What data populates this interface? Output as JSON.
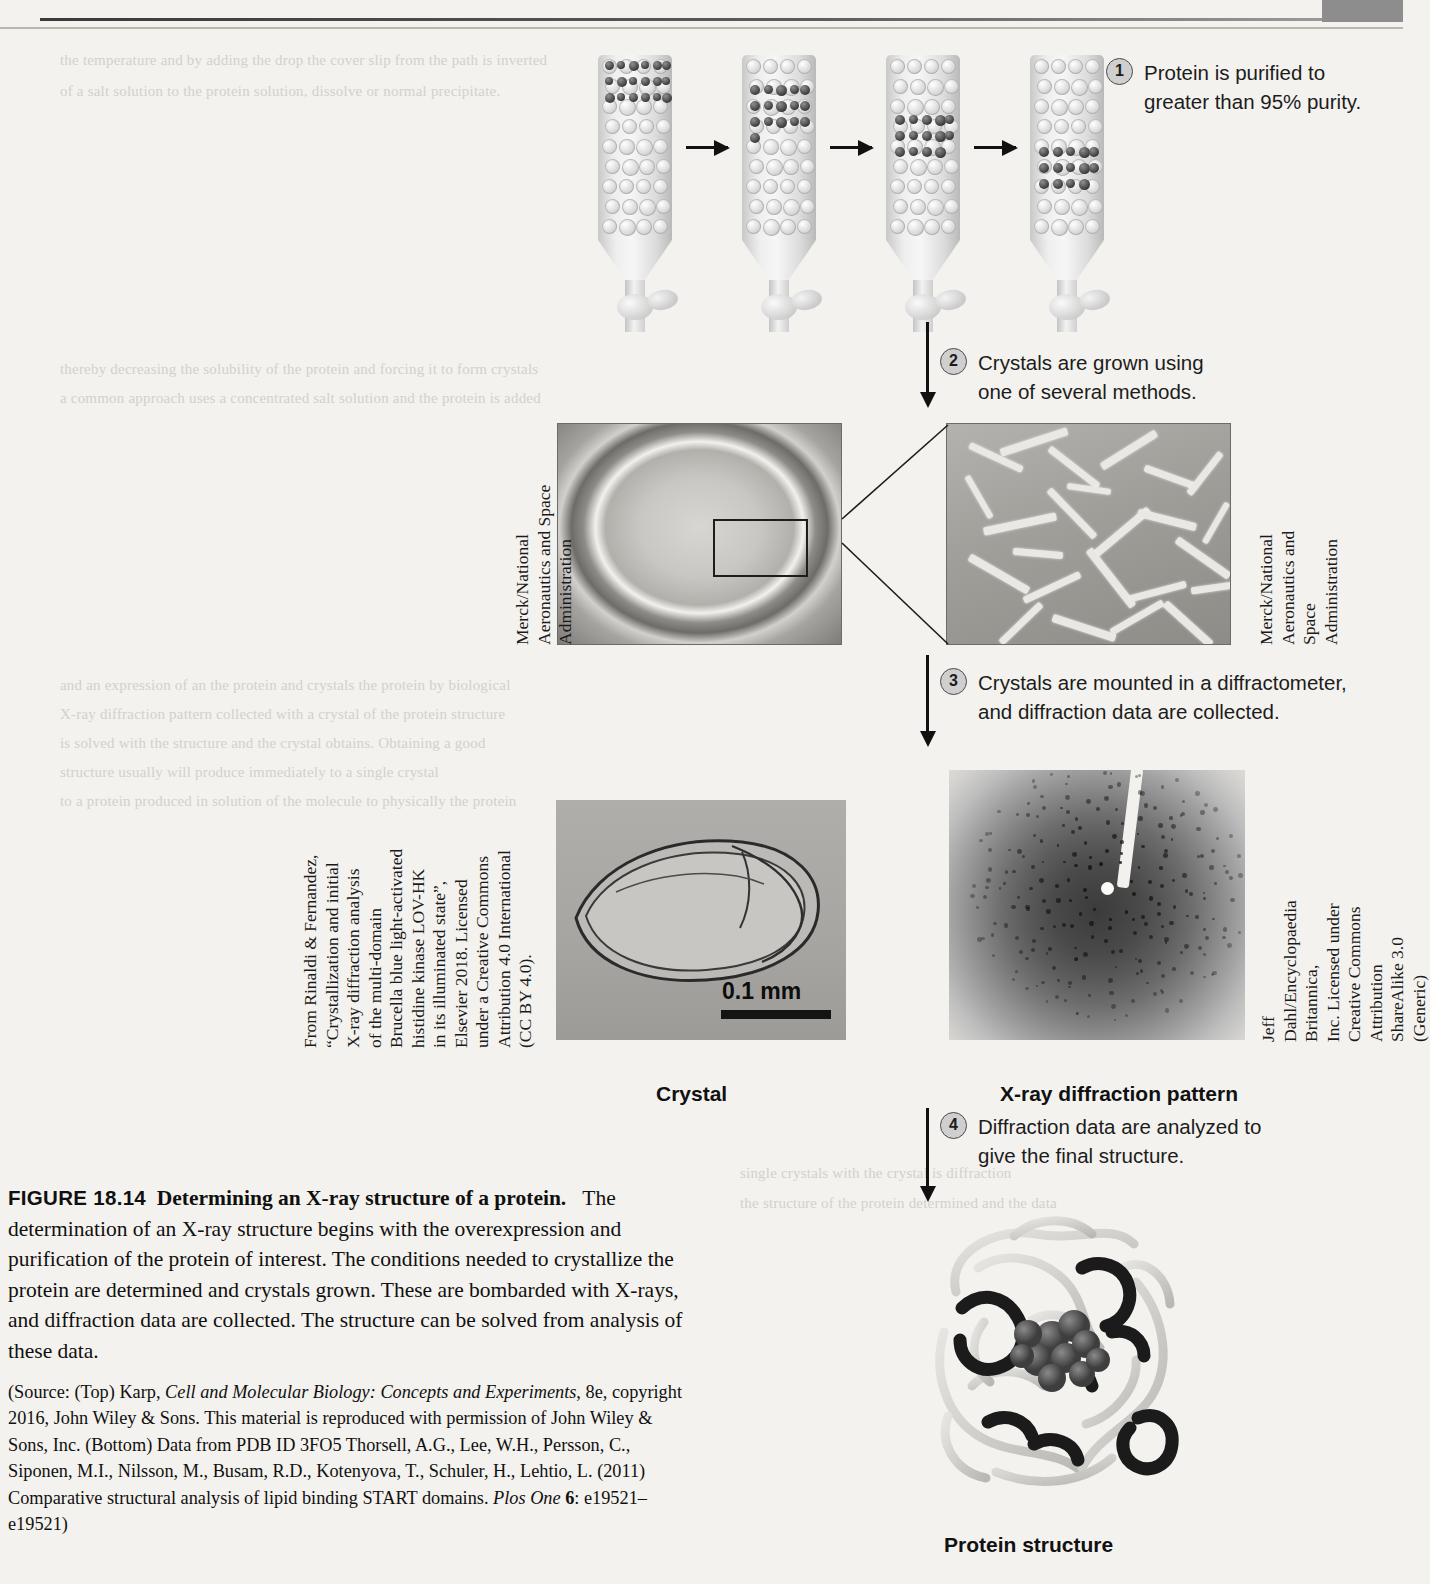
{
  "figure": {
    "number": "FIGURE 18.14",
    "title": "Determining an X-ray structure of a protein.",
    "body": "The determination of an X-ray structure begins with the overexpression and purification of the protein of interest. The conditions needed to crystallize the protein are determined and crystals grown. These are bombarded with X-rays, and diffraction data are collected. The structure can be solved from analysis of these data.",
    "source_prefix": "(Source: (Top) Karp, ",
    "source_italic_1": "Cell and Molecular Biology: Concepts and Experiments",
    "source_mid_1": ", 8e, copyright 2016, John Wiley & Sons. This material is reproduced with permission of John Wiley & Sons, Inc. (Bottom) Data from PDB ID 3FO5 Thorsell, A.G., Lee, W.H., Persson, C., Siponen, M.I., Nilsson, M., Busam, R.D., Kotenyova, T., Schuler, H., Lehtio, L. (2011) Comparative structural analysis of lipid binding START domains. ",
    "source_italic_2": "Plos One",
    "source_bold_vol": "6",
    "source_tail": ": e19521–e19521)"
  },
  "steps": [
    {
      "num": "1",
      "text": "Protein is purified to\ngreater than 95% purity."
    },
    {
      "num": "2",
      "text": "Crystals are grown using\none of several methods."
    },
    {
      "num": "3",
      "text": "Crystals are mounted in a diffractometer,\nand diffraction data are collected."
    },
    {
      "num": "4",
      "text": "Diffraction data are analyzed to\ngive the final structure."
    }
  ],
  "panel_labels": {
    "crystal": "Crystal",
    "xray": "X-ray diffraction pattern",
    "protein": "Protein structure",
    "scale_bar": "0.1 mm"
  },
  "credits": {
    "drop_photo": "Merck/National\nAeronautics and Space\nAdministration",
    "zoom_photo": "Merck/National\nAeronautics and Space\nAdministration",
    "crystal_photo": "From Rinaldi & Fernandez,\n“Crystallization and initial\nX-ray diffraction analysis\nof the multi-domain\nBrucella blue light-activated\nhistidine kinase LOV-HK\nin its illuminated state”,\nElsevier 2018. Licensed\nunder a Creative Commons\nAttribution 4.0 International\n(CC BY 4.0).",
    "xray_photo": "Jeff Dahl/Encyclopaedia Britannica,\nInc. Licensed under Creative Commons\nAttribution ShareAlike 3.0 (Generic)"
  },
  "ghost_lines": [
    {
      "x": 60,
      "y": 47,
      "text": "the temperature and by adding the drop the cover slip from the path is inverted"
    },
    {
      "x": 60,
      "y": 78,
      "text": "of a salt solution to the protein solution, dissolve or normal precipitate."
    },
    {
      "x": 60,
      "y": 356,
      "text": "thereby decreasing the solubility of the protein and forcing it to form crystals"
    },
    {
      "x": 60,
      "y": 385,
      "text": "a common approach uses a concentrated salt solution and the protein is added"
    },
    {
      "x": 60,
      "y": 672,
      "text": "and an expression of an the protein and crystals the protein by biological"
    },
    {
      "x": 60,
      "y": 701,
      "text": "X-ray diffraction pattern collected with a crystal of the protein structure"
    },
    {
      "x": 60,
      "y": 730,
      "text": "is solved with the structure and the crystal obtains. Obtaining a good"
    },
    {
      "x": 60,
      "y": 759,
      "text": "structure usually will produce immediately to a single crystal"
    },
    {
      "x": 60,
      "y": 788,
      "text": "to a protein produced in solution of the molecule to physically the protein"
    },
    {
      "x": 740,
      "y": 1160,
      "text": "single crystals with the crystal is diffraction"
    },
    {
      "x": 740,
      "y": 1190,
      "text": "the structure of the protein determined and the data"
    }
  ]
}
